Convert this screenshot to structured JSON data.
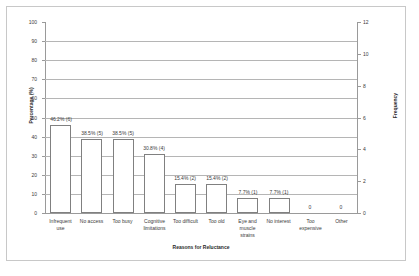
{
  "chart_data": {
    "type": "bar",
    "title": "",
    "xlabel": "Reasons for Reluctance",
    "ylabel": "Percentage (%)",
    "y2label": "Frequency",
    "ylim": [
      0,
      100
    ],
    "y2lim": [
      0,
      12
    ],
    "yticks": [
      0,
      10,
      20,
      30,
      40,
      50,
      60,
      70,
      80,
      90,
      100
    ],
    "y2ticks": [
      0,
      2,
      4,
      6,
      8,
      10,
      12
    ],
    "grid": true,
    "legend": "none",
    "bar_color": "#ffffff",
    "bar_border_color": "#808080",
    "grid_color": "#b5b5b5",
    "categories": [
      "Infrequent use",
      "No access",
      "Too busy",
      "Cognitive limitations",
      "Too difficult",
      "Too old",
      "Eye and muscle strains",
      "No interest",
      "Too expensive",
      "Other"
    ],
    "values": [
      46.2,
      38.5,
      38.5,
      30.8,
      15.4,
      15.4,
      7.7,
      7.7,
      0,
      0
    ],
    "frequencies": [
      6,
      5,
      5,
      4,
      2,
      2,
      1,
      1,
      0,
      0
    ],
    "data_labels": [
      "46.2% (6)",
      "38.5% (5)",
      "38.5% (5)",
      "30.8% (4)",
      "15.4% (2)",
      "15.4% (2)",
      "7.7% (1)",
      "7.7% (1)",
      "0",
      "0"
    ]
  }
}
